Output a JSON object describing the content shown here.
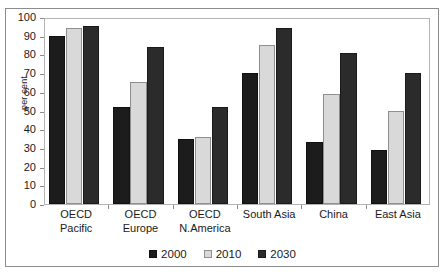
{
  "chart_data": {
    "type": "bar",
    "title": "",
    "xlabel": "",
    "ylabel": "per cent",
    "ylim": [
      0,
      100
    ],
    "ytick_step": 10,
    "yticks": [
      100,
      90,
      80,
      70,
      60,
      50,
      40,
      30,
      20,
      10,
      0
    ],
    "grid": false,
    "legend_position": "bottom-center",
    "categories": [
      "OECD\nPacific",
      "OECD\nEurope",
      "OECD\nN.America",
      "South Asia",
      "China",
      "East Asia"
    ],
    "series": [
      {
        "name": "2000",
        "color": "#1c1c1c",
        "values": [
          90,
          52,
          35,
          70,
          33,
          29
        ]
      },
      {
        "name": "2010",
        "color": "#d9d9d9",
        "values": [
          94,
          65,
          36,
          85,
          59,
          50
        ]
      },
      {
        "name": "2030",
        "color": "#2b2b2b",
        "values": [
          95,
          84,
          52,
          94,
          81,
          70
        ]
      }
    ]
  },
  "legend": {
    "items": [
      {
        "label": "2000"
      },
      {
        "label": "2010"
      },
      {
        "label": "2030"
      }
    ]
  }
}
